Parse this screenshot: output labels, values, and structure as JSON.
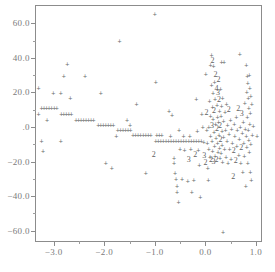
{
  "chart_data": {
    "type": "scatter",
    "title": "",
    "subtitle": "",
    "xlabel": "",
    "ylabel": "",
    "xlim": [
      -3.35,
      1.1
    ],
    "ylim": [
      -66,
      70
    ],
    "grid": false,
    "legend": null,
    "marker": "+",
    "overplot_codes": {
      "2": "2 points coincide",
      "3": "3 points coincide",
      "4": "4 points coincide"
    },
    "xticks": [
      -3.0,
      -2.0,
      -1.0,
      0.0,
      1.0
    ],
    "xticklabels": [
      "-3.0",
      "-2.0",
      "-1.0",
      "0.0",
      "1.0"
    ],
    "yticks": [
      60,
      40,
      20,
      0,
      -20,
      -40,
      -60
    ],
    "yticklabels": [
      "60.0",
      "40.0",
      "20.0",
      ".0",
      "-20.0",
      "-40.0",
      "-60.0"
    ],
    "points": [
      {
        "x": -3.3,
        "y": 22.5,
        "n": 1
      },
      {
        "x": -3.3,
        "y": 7.6,
        "n": 1
      },
      {
        "x": -3.24,
        "y": -8.4,
        "n": 1
      },
      {
        "x": -3.21,
        "y": -14.2,
        "n": 1
      },
      {
        "x": -3.13,
        "y": 4.0,
        "n": 1
      },
      {
        "x": -3.01,
        "y": 19.5,
        "n": 1
      },
      {
        "x": -2.86,
        "y": 19.5,
        "n": 1
      },
      {
        "x": -2.86,
        "y": -8.2,
        "n": 1
      },
      {
        "x": -2.8,
        "y": 29.5,
        "n": 1
      },
      {
        "x": -2.73,
        "y": 36.2,
        "n": 1
      },
      {
        "x": -2.67,
        "y": 16.5,
        "n": 1
      },
      {
        "x": -2.38,
        "y": 29.3,
        "n": 1
      },
      {
        "x": -2.07,
        "y": 19.6,
        "n": 1
      },
      {
        "x": -1.97,
        "y": -20.6,
        "n": 1
      },
      {
        "x": -1.85,
        "y": -23.9,
        "n": 1
      },
      {
        "x": -1.76,
        "y": -5.0,
        "n": 1
      },
      {
        "x": -1.7,
        "y": 49.8,
        "n": 1
      },
      {
        "x": -1.55,
        "y": 4.0,
        "n": 1
      },
      {
        "x": -1.49,
        "y": 1.3,
        "n": 1
      },
      {
        "x": -1.36,
        "y": 13.0,
        "n": 1
      },
      {
        "x": -1.18,
        "y": -26.9,
        "n": 1
      },
      {
        "x": -1.0,
        "y": 65.2,
        "n": 1
      },
      {
        "x": -0.98,
        "y": 25.8,
        "n": 1
      },
      {
        "x": -1.02,
        "y": -16.2,
        "n": 2
      },
      {
        "x": -0.72,
        "y": 9.5,
        "n": 1
      },
      {
        "x": -0.69,
        "y": -5.5,
        "n": 1
      },
      {
        "x": -0.66,
        "y": 6.8,
        "n": 1
      },
      {
        "x": -0.62,
        "y": -18.0,
        "n": 1
      },
      {
        "x": -0.62,
        "y": -20.8,
        "n": 1
      },
      {
        "x": -0.6,
        "y": -26.8,
        "n": 1
      },
      {
        "x": -0.58,
        "y": -30.3,
        "n": 1
      },
      {
        "x": -0.56,
        "y": -34.0,
        "n": 1
      },
      {
        "x": -0.56,
        "y": -37.4,
        "n": 1
      },
      {
        "x": -0.53,
        "y": -43.6,
        "n": 1
      },
      {
        "x": -0.52,
        "y": -2.0,
        "n": 1
      },
      {
        "x": -0.5,
        "y": -13.0,
        "n": 1
      },
      {
        "x": -0.46,
        "y": -30.3,
        "n": 1
      },
      {
        "x": -0.43,
        "y": -5.2,
        "n": 1
      },
      {
        "x": -0.41,
        "y": -13.5,
        "n": 1
      },
      {
        "x": -0.35,
        "y": -31.0,
        "n": 1
      },
      {
        "x": -0.33,
        "y": -19.2,
        "n": 3
      },
      {
        "x": -0.31,
        "y": -5.2,
        "n": 1
      },
      {
        "x": -0.29,
        "y": -13.0,
        "n": 1
      },
      {
        "x": -0.27,
        "y": -37.8,
        "n": 1
      },
      {
        "x": -0.23,
        "y": -30.6,
        "n": 1
      },
      {
        "x": -0.2,
        "y": -16.4,
        "n": 2
      },
      {
        "x": -0.18,
        "y": 16.2,
        "n": 1
      },
      {
        "x": -0.16,
        "y": -2.2,
        "n": 1
      },
      {
        "x": -0.14,
        "y": -13.2,
        "n": 1
      },
      {
        "x": -0.12,
        "y": -22.0,
        "n": 1
      },
      {
        "x": -0.1,
        "y": -40.3,
        "n": 1
      },
      {
        "x": -0.07,
        "y": 7.6,
        "n": 1
      },
      {
        "x": -0.05,
        "y": -0.2,
        "n": 1
      },
      {
        "x": -0.03,
        "y": -8.5,
        "n": 1
      },
      {
        "x": -0.02,
        "y": -16.6,
        "n": 3
      },
      {
        "x": 0.0,
        "y": -21.0,
        "n": 2
      },
      {
        "x": 0.01,
        "y": 30.8,
        "n": 1
      },
      {
        "x": 0.02,
        "y": 8.0,
        "n": 2
      },
      {
        "x": 0.03,
        "y": -1.8,
        "n": 1
      },
      {
        "x": 0.04,
        "y": -9.0,
        "n": 1
      },
      {
        "x": 0.05,
        "y": -24.0,
        "n": 1
      },
      {
        "x": 0.06,
        "y": -30.6,
        "n": 1
      },
      {
        "x": 0.07,
        "y": 0.2,
        "n": 1
      },
      {
        "x": 0.07,
        "y": -12.8,
        "n": 1
      },
      {
        "x": 0.08,
        "y": 14.8,
        "n": 1
      },
      {
        "x": 0.09,
        "y": -17.2,
        "n": 1
      },
      {
        "x": 0.1,
        "y": 36.0,
        "n": 1
      },
      {
        "x": 0.1,
        "y": 6.5,
        "n": 1
      },
      {
        "x": 0.1,
        "y": -5.0,
        "n": 1
      },
      {
        "x": 0.11,
        "y": -19.4,
        "n": 2
      },
      {
        "x": 0.12,
        "y": 41.5,
        "n": 1
      },
      {
        "x": 0.12,
        "y": 24.2,
        "n": 1
      },
      {
        "x": 0.13,
        "y": 0.6,
        "n": 3
      },
      {
        "x": 0.13,
        "y": -8.0,
        "n": 1
      },
      {
        "x": 0.14,
        "y": 38.2,
        "n": 2
      },
      {
        "x": 0.14,
        "y": 11.5,
        "n": 1
      },
      {
        "x": 0.14,
        "y": -14.0,
        "n": 1
      },
      {
        "x": 0.15,
        "y": 19.5,
        "n": 1
      },
      {
        "x": 0.15,
        "y": 4.5,
        "n": 1
      },
      {
        "x": 0.16,
        "y": 35.0,
        "n": 1
      },
      {
        "x": 0.16,
        "y": -20.0,
        "n": 3
      },
      {
        "x": 0.17,
        "y": 9.0,
        "n": 2
      },
      {
        "x": 0.17,
        "y": -3.0,
        "n": 1
      },
      {
        "x": 0.18,
        "y": 26.0,
        "n": 1
      },
      {
        "x": 0.18,
        "y": -11.0,
        "n": 1
      },
      {
        "x": 0.19,
        "y": 16.0,
        "n": 1
      },
      {
        "x": 0.19,
        "y": -16.8,
        "n": 1
      },
      {
        "x": 0.2,
        "y": 30.0,
        "n": 2
      },
      {
        "x": 0.2,
        "y": 1.8,
        "n": 1
      },
      {
        "x": 0.21,
        "y": -6.5,
        "n": 1
      },
      {
        "x": 0.22,
        "y": 21.8,
        "n": 4
      },
      {
        "x": 0.22,
        "y": -19.0,
        "n": 2
      },
      {
        "x": 0.23,
        "y": 12.5,
        "n": 1
      },
      {
        "x": 0.23,
        "y": -1.0,
        "n": 2
      },
      {
        "x": 0.24,
        "y": 6.0,
        "n": 1
      },
      {
        "x": 0.24,
        "y": -9.5,
        "n": 1
      },
      {
        "x": 0.25,
        "y": 19.8,
        "n": 3
      },
      {
        "x": 0.25,
        "y": -14.5,
        "n": 1
      },
      {
        "x": 0.26,
        "y": 27.0,
        "n": 2
      },
      {
        "x": 0.26,
        "y": 3.0,
        "n": 1
      },
      {
        "x": 0.27,
        "y": 15.5,
        "n": 2
      },
      {
        "x": 0.27,
        "y": -4.5,
        "n": 1
      },
      {
        "x": 0.28,
        "y": 9.5,
        "n": 1
      },
      {
        "x": 0.28,
        "y": -12.0,
        "n": 1
      },
      {
        "x": 0.29,
        "y": 0.5,
        "n": 2
      },
      {
        "x": 0.29,
        "y": -18.2,
        "n": 1
      },
      {
        "x": 0.3,
        "y": 22.0,
        "n": 1
      },
      {
        "x": 0.3,
        "y": -7.5,
        "n": 2
      },
      {
        "x": 0.31,
        "y": 6.2,
        "n": 1
      },
      {
        "x": 0.31,
        "y": -15.0,
        "n": 1
      },
      {
        "x": 0.32,
        "y": 37.8,
        "n": 1
      },
      {
        "x": 0.32,
        "y": 12.0,
        "n": 1
      },
      {
        "x": 0.33,
        "y": -2.5,
        "n": 1
      },
      {
        "x": 0.33,
        "y": -10.5,
        "n": 1
      },
      {
        "x": 0.34,
        "y": 17.0,
        "n": 1
      },
      {
        "x": 0.34,
        "y": -20.2,
        "n": 1
      },
      {
        "x": 0.35,
        "y": -61.0,
        "n": 1
      },
      {
        "x": 0.36,
        "y": 3.5,
        "n": 1
      },
      {
        "x": 0.36,
        "y": -6.0,
        "n": 1
      },
      {
        "x": 0.37,
        "y": 37.5,
        "n": 1
      },
      {
        "x": 0.38,
        "y": -13.0,
        "n": 1
      },
      {
        "x": 0.39,
        "y": 8.5,
        "n": 1
      },
      {
        "x": 0.4,
        "y": -1.5,
        "n": 1
      },
      {
        "x": 0.41,
        "y": -17.5,
        "n": 1
      },
      {
        "x": 0.42,
        "y": 13.5,
        "n": 1
      },
      {
        "x": 0.43,
        "y": -8.0,
        "n": 1
      },
      {
        "x": 0.44,
        "y": 1.0,
        "n": 1
      },
      {
        "x": 0.45,
        "y": -21.0,
        "n": 1
      },
      {
        "x": 0.46,
        "y": 9.8,
        "n": 2
      },
      {
        "x": 0.47,
        "y": -4.0,
        "n": 1
      },
      {
        "x": 0.48,
        "y": -12.5,
        "n": 1
      },
      {
        "x": 0.5,
        "y": 4.0,
        "n": 1
      },
      {
        "x": 0.51,
        "y": -18.8,
        "n": 1
      },
      {
        "x": 0.52,
        "y": -1.0,
        "n": 1
      },
      {
        "x": 0.53,
        "y": -9.0,
        "n": 1
      },
      {
        "x": 0.55,
        "y": -29.0,
        "n": 2
      },
      {
        "x": 0.56,
        "y": -14.0,
        "n": 2
      },
      {
        "x": 0.57,
        "y": 2.0,
        "n": 1
      },
      {
        "x": 0.58,
        "y": -5.5,
        "n": 1
      },
      {
        "x": 0.6,
        "y": -19.5,
        "n": 2
      },
      {
        "x": 0.61,
        "y": 6.0,
        "n": 1
      },
      {
        "x": 0.62,
        "y": -11.0,
        "n": 1
      },
      {
        "x": 0.63,
        "y": -2.0,
        "n": 1
      },
      {
        "x": 0.65,
        "y": 10.5,
        "n": 2
      },
      {
        "x": 0.66,
        "y": -16.0,
        "n": 1
      },
      {
        "x": 0.67,
        "y": -7.0,
        "n": 1
      },
      {
        "x": 0.68,
        "y": 42.5,
        "n": 1
      },
      {
        "x": 0.69,
        "y": 0.0,
        "n": 1
      },
      {
        "x": 0.7,
        "y": -21.0,
        "n": 1
      },
      {
        "x": 0.71,
        "y": -12.2,
        "n": 2
      },
      {
        "x": 0.72,
        "y": 7.5,
        "n": 3
      },
      {
        "x": 0.73,
        "y": -3.5,
        "n": 1
      },
      {
        "x": 0.74,
        "y": -26.0,
        "n": 1
      },
      {
        "x": 0.75,
        "y": 3.0,
        "n": 1
      },
      {
        "x": 0.76,
        "y": -9.0,
        "n": 1
      },
      {
        "x": 0.77,
        "y": -17.0,
        "n": 1
      },
      {
        "x": 0.78,
        "y": 14.0,
        "n": 1
      },
      {
        "x": 0.79,
        "y": -1.0,
        "n": 1
      },
      {
        "x": 0.8,
        "y": -34.0,
        "n": 1
      },
      {
        "x": 0.81,
        "y": 35.8,
        "n": 1
      },
      {
        "x": 0.81,
        "y": -5.0,
        "n": 1
      },
      {
        "x": 0.82,
        "y": 20.0,
        "n": 1
      },
      {
        "x": 0.82,
        "y": -11.5,
        "n": 1
      },
      {
        "x": 0.83,
        "y": 29.5,
        "n": 1
      },
      {
        "x": 0.83,
        "y": 5.5,
        "n": 1
      },
      {
        "x": 0.84,
        "y": 25.5,
        "n": 1
      },
      {
        "x": 0.84,
        "y": -20.8,
        "n": 1
      },
      {
        "x": 0.85,
        "y": 16.5,
        "n": 1
      },
      {
        "x": 0.85,
        "y": -2.0,
        "n": 1
      },
      {
        "x": 0.86,
        "y": 11.0,
        "n": 1
      },
      {
        "x": 0.86,
        "y": -7.5,
        "n": 1
      },
      {
        "x": 0.87,
        "y": 29.8,
        "n": 1
      },
      {
        "x": 0.87,
        "y": -14.5,
        "n": 1
      },
      {
        "x": 0.88,
        "y": 22.5,
        "n": 1
      },
      {
        "x": 0.88,
        "y": 1.5,
        "n": 1
      },
      {
        "x": 0.89,
        "y": 8.0,
        "n": 1
      },
      {
        "x": 0.89,
        "y": -26.0,
        "n": 1
      },
      {
        "x": 0.9,
        "y": 18.0,
        "n": 1
      },
      {
        "x": 0.9,
        "y": -10.0,
        "n": 1
      },
      {
        "x": 0.91,
        "y": -30.5,
        "n": 1
      },
      {
        "x": 0.92,
        "y": 13.0,
        "n": 1
      },
      {
        "x": 0.93,
        "y": -4.5,
        "n": 1
      },
      {
        "x": 0.95,
        "y": 0.5,
        "n": 1
      },
      {
        "x": 1.02,
        "y": -5.5,
        "n": 1
      },
      {
        "x": -3.24,
        "y": 11.0,
        "n": 1
      },
      {
        "x": -3.19,
        "y": 11.0,
        "n": 1
      },
      {
        "x": -3.14,
        "y": 11.0,
        "n": 1
      },
      {
        "x": -3.09,
        "y": 11.0,
        "n": 1
      },
      {
        "x": -3.04,
        "y": 11.0,
        "n": 1
      },
      {
        "x": -2.99,
        "y": 11.0,
        "n": 1
      },
      {
        "x": -2.94,
        "y": 11.0,
        "n": 1
      },
      {
        "x": -2.85,
        "y": 7.6,
        "n": 1
      },
      {
        "x": -2.8,
        "y": 7.6,
        "n": 1
      },
      {
        "x": -2.75,
        "y": 7.6,
        "n": 1
      },
      {
        "x": -2.7,
        "y": 7.6,
        "n": 1
      },
      {
        "x": -2.65,
        "y": 7.6,
        "n": 1
      },
      {
        "x": -2.56,
        "y": 4.2,
        "n": 1
      },
      {
        "x": -2.51,
        "y": 4.2,
        "n": 1
      },
      {
        "x": -2.46,
        "y": 4.2,
        "n": 1
      },
      {
        "x": -2.41,
        "y": 4.2,
        "n": 1
      },
      {
        "x": -2.36,
        "y": 4.2,
        "n": 1
      },
      {
        "x": -2.31,
        "y": 4.2,
        "n": 1
      },
      {
        "x": -2.26,
        "y": 4.2,
        "n": 1
      },
      {
        "x": -2.21,
        "y": 4.2,
        "n": 1
      },
      {
        "x": -2.12,
        "y": 1.4,
        "n": 1
      },
      {
        "x": -2.07,
        "y": 1.4,
        "n": 1
      },
      {
        "x": -2.02,
        "y": 1.4,
        "n": 1
      },
      {
        "x": -1.97,
        "y": 1.4,
        "n": 1
      },
      {
        "x": -1.92,
        "y": 1.4,
        "n": 1
      },
      {
        "x": -1.87,
        "y": 1.4,
        "n": 1
      },
      {
        "x": -1.82,
        "y": 1.4,
        "n": 1
      },
      {
        "x": -1.73,
        "y": -1.6,
        "n": 1
      },
      {
        "x": -1.68,
        "y": -1.6,
        "n": 1
      },
      {
        "x": -1.63,
        "y": -1.6,
        "n": 1
      },
      {
        "x": -1.58,
        "y": -1.6,
        "n": 1
      },
      {
        "x": -1.53,
        "y": -1.6,
        "n": 1
      },
      {
        "x": -1.48,
        "y": -1.6,
        "n": 1
      },
      {
        "x": -1.43,
        "y": -4.6,
        "n": 1
      },
      {
        "x": -1.38,
        "y": -4.6,
        "n": 1
      },
      {
        "x": -1.33,
        "y": -4.6,
        "n": 1
      },
      {
        "x": -1.28,
        "y": -4.6,
        "n": 1
      },
      {
        "x": -1.23,
        "y": -4.6,
        "n": 1
      },
      {
        "x": -1.18,
        "y": -4.6,
        "n": 1
      },
      {
        "x": -1.13,
        "y": -4.6,
        "n": 1
      },
      {
        "x": -1.08,
        "y": -4.6,
        "n": 1
      },
      {
        "x": -0.98,
        "y": -8.2,
        "n": 1
      },
      {
        "x": -0.93,
        "y": -8.2,
        "n": 1
      },
      {
        "x": -0.88,
        "y": -8.2,
        "n": 1
      },
      {
        "x": -0.83,
        "y": -8.2,
        "n": 1
      },
      {
        "x": -0.78,
        "y": -8.2,
        "n": 1
      },
      {
        "x": -0.73,
        "y": -8.2,
        "n": 1
      },
      {
        "x": -0.68,
        "y": -8.2,
        "n": 1
      },
      {
        "x": -0.63,
        "y": -8.2,
        "n": 1
      },
      {
        "x": -0.58,
        "y": -8.2,
        "n": 1
      },
      {
        "x": -0.53,
        "y": -8.2,
        "n": 1
      },
      {
        "x": -0.48,
        "y": -8.2,
        "n": 1
      },
      {
        "x": -0.43,
        "y": -8.2,
        "n": 1
      },
      {
        "x": -0.38,
        "y": -8.2,
        "n": 1
      },
      {
        "x": -0.33,
        "y": -8.2,
        "n": 1
      },
      {
        "x": -0.28,
        "y": -8.2,
        "n": 1
      },
      {
        "x": -0.23,
        "y": -8.2,
        "n": 1
      },
      {
        "x": -0.18,
        "y": -8.2,
        "n": 1
      },
      {
        "x": -0.13,
        "y": -8.2,
        "n": 1
      },
      {
        "x": -0.08,
        "y": -8.2,
        "n": 1
      },
      {
        "x": -0.96,
        "y": -4.8,
        "n": 1
      },
      {
        "x": -0.91,
        "y": -4.8,
        "n": 1
      },
      {
        "x": -0.86,
        "y": -4.8,
        "n": 1
      }
    ]
  },
  "axes": {
    "x_axis_title": ""
  }
}
